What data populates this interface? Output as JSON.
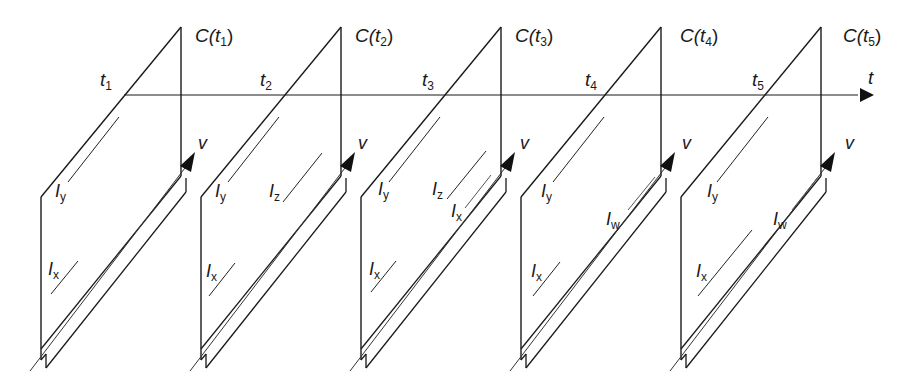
{
  "diagram": {
    "axis": {
      "label": "t",
      "color": "#1a1a1a"
    },
    "panels": [
      {
        "id": 1,
        "time_label": "t",
        "time_sub": "1",
        "cam_label": "C(t",
        "cam_sub": "1",
        "cam_close": ")",
        "velocity_label": "v",
        "features": [
          {
            "name": "I",
            "sub": "y"
          },
          {
            "name": "I",
            "sub": "x"
          }
        ]
      },
      {
        "id": 2,
        "time_label": "t",
        "time_sub": "2",
        "cam_label": "C(t",
        "cam_sub": "2",
        "cam_close": ")",
        "velocity_label": "v",
        "features": [
          {
            "name": "I",
            "sub": "y"
          },
          {
            "name": "I",
            "sub": "z"
          },
          {
            "name": "I",
            "sub": "x"
          }
        ]
      },
      {
        "id": 3,
        "time_label": "t",
        "time_sub": "3",
        "cam_label": "C(t",
        "cam_sub": "3",
        "cam_close": ")",
        "velocity_label": "v",
        "features": [
          {
            "name": "I",
            "sub": "y"
          },
          {
            "name": "I",
            "sub": "z"
          },
          {
            "name": "I",
            "sub": "x"
          },
          {
            "name": "I",
            "sub": "x"
          }
        ]
      },
      {
        "id": 4,
        "time_label": "t",
        "time_sub": "4",
        "cam_label": "C(t",
        "cam_sub": "4",
        "cam_close": ")",
        "velocity_label": "v",
        "features": [
          {
            "name": "I",
            "sub": "y"
          },
          {
            "name": "I",
            "sub": "w"
          },
          {
            "name": "I",
            "sub": "x"
          }
        ]
      },
      {
        "id": 5,
        "time_label": "t",
        "time_sub": "5",
        "cam_label": "C(t",
        "cam_sub": "5",
        "cam_close": ")",
        "velocity_label": "v",
        "features": [
          {
            "name": "I",
            "sub": "y"
          },
          {
            "name": "I",
            "sub": "w"
          },
          {
            "name": "I",
            "sub": "x"
          }
        ]
      }
    ]
  }
}
